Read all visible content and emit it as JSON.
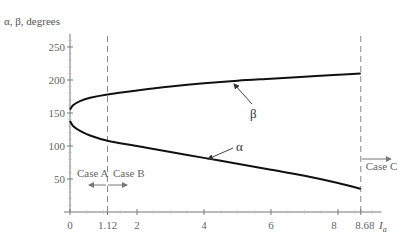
{
  "chart_data": {
    "type": "line",
    "title": "",
    "ylabel": "α, β, degrees",
    "xlabel": "I",
    "xlabel_subscript": "a",
    "xlim": [
      0,
      9.2
    ],
    "ylim": [
      0,
      270
    ],
    "x_ticks": [
      0,
      2,
      4,
      6,
      8
    ],
    "x_tick_labels": [
      "0",
      "1.12",
      "2",
      "4",
      "6",
      "8",
      "8.68"
    ],
    "x_special_ticks": [
      1.12,
      8.68
    ],
    "y_ticks": [
      50,
      100,
      150,
      200,
      250
    ],
    "y_tick_labels": [
      "50",
      "100",
      "150",
      "200",
      "250"
    ],
    "grid": false,
    "series": [
      {
        "name": "β",
        "x": [
          0,
          0.1,
          0.3,
          0.6,
          1.12,
          2,
          3,
          4,
          5,
          6,
          7,
          8,
          8.68
        ],
        "values": [
          155,
          162,
          168,
          173,
          178,
          184,
          190,
          195,
          199,
          202,
          205,
          208,
          210
        ]
      },
      {
        "name": "α",
        "x": [
          0,
          0.1,
          0.3,
          0.6,
          1.12,
          2,
          3,
          4,
          5,
          6,
          7,
          8,
          8.68
        ],
        "values": [
          138,
          130,
          123,
          116,
          108,
          100,
          91,
          82,
          73,
          64,
          55,
          44,
          35
        ]
      }
    ],
    "annotations": [
      {
        "text": "β",
        "points_to_x": 6.5,
        "series": "β"
      },
      {
        "text": "α",
        "points_to_x": 4.5,
        "series": "α"
      },
      {
        "text": "Case A",
        "direction": "left"
      },
      {
        "text": "Case B",
        "direction": "right"
      },
      {
        "text": "Case C",
        "direction": "right"
      }
    ],
    "vlines": [
      1.12,
      8.68
    ]
  }
}
